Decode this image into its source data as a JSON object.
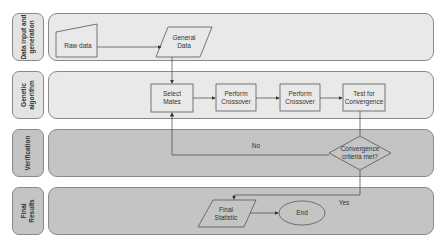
{
  "lanes": [
    {
      "label": "Data input and\ngeneration",
      "shade": "light"
    },
    {
      "label": "Genetic\nalgorithm",
      "shade": "light"
    },
    {
      "label": "Verification",
      "shade": "dark"
    },
    {
      "label": "Final\nResults",
      "shade": "dark"
    }
  ],
  "nodes": {
    "raw_data": "Raw data",
    "general_data": "General\nData",
    "select_mates": "Select\nMates",
    "crossover_1": "Perform\nCrossover",
    "crossover_2": "Perform\nCrossover",
    "test_convergence": "Test for\nConvergence",
    "decision": "Convergence\ncriteria met?",
    "final_statistic": "Final\nStatistic",
    "end": "End"
  },
  "edge_labels": {
    "no": "No",
    "yes": "Yes"
  },
  "colors": {
    "light_lane": "#e9e9e9",
    "dark_lane": "#c4c4c4",
    "stroke": "#555555"
  }
}
